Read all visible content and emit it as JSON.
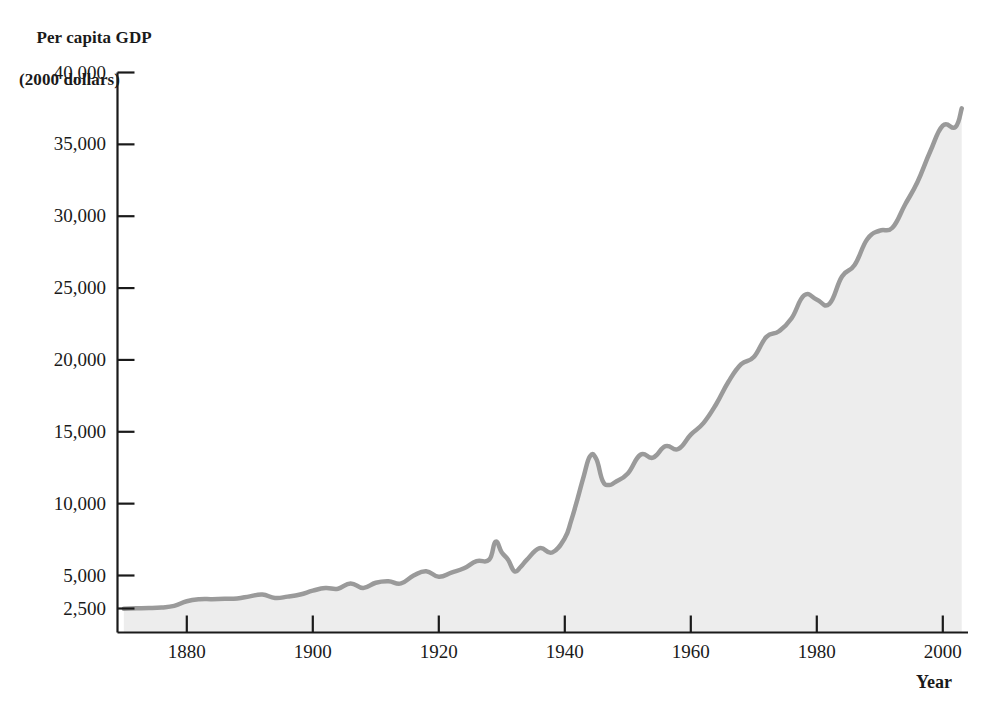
{
  "figure": {
    "y_axis_title_line1": "Per capita GDP",
    "y_axis_title_line2": "(2000 dollars)",
    "x_axis_title": "Year"
  },
  "colors": {
    "line": "#9a9a9a",
    "fill": "#ededed",
    "axis": "#1a1a1a",
    "text": "#1a1a1a",
    "background": "#ffffff"
  },
  "chart_data": {
    "type": "area",
    "title": "Per capita GDP (2000 dollars)",
    "xlabel": "Year",
    "ylabel": "Per capita GDP (2000 dollars)",
    "grid": false,
    "legend": "none",
    "xlim": [
      1869,
      2004
    ],
    "ylim": [
      2100,
      40000
    ],
    "ytick_values": [
      40000,
      35000,
      30000,
      25000,
      20000,
      15000,
      10000,
      5000,
      2500
    ],
    "ytick_labels": [
      "40,000",
      "35,000",
      "30,000",
      "25,000",
      "20,000",
      "15,000",
      "10,000",
      "5,000",
      "2,500"
    ],
    "xtick_values": [
      1880,
      1900,
      1920,
      1940,
      1960,
      1980,
      2000
    ],
    "xtick_labels": [
      "1880",
      "1900",
      "1920",
      "1940",
      "1960",
      "1980",
      "2000"
    ],
    "series": [
      {
        "name": "Per capita GDP",
        "x": [
          1870,
          1872,
          1874,
          1876,
          1878,
          1880,
          1882,
          1884,
          1886,
          1888,
          1890,
          1892,
          1894,
          1896,
          1898,
          1900,
          1902,
          1904,
          1906,
          1908,
          1910,
          1912,
          1914,
          1916,
          1918,
          1920,
          1922,
          1924,
          1926,
          1928,
          1929,
          1930,
          1931,
          1932,
          1933,
          1934,
          1936,
          1938,
          1940,
          1941,
          1942,
          1943,
          1944,
          1945,
          1946,
          1947,
          1948,
          1950,
          1952,
          1954,
          1956,
          1958,
          1960,
          1962,
          1964,
          1966,
          1968,
          1970,
          1972,
          1974,
          1976,
          1978,
          1980,
          1982,
          1984,
          1986,
          1988,
          1990,
          1992,
          1994,
          1996,
          1998,
          2000,
          2002,
          2003
        ],
        "values": [
          2490,
          2510,
          2530,
          2580,
          2700,
          3050,
          3200,
          3210,
          3230,
          3260,
          3420,
          3560,
          3300,
          3400,
          3560,
          3850,
          4050,
          4000,
          4400,
          4050,
          4450,
          4560,
          4400,
          5000,
          5300,
          4900,
          5200,
          5500,
          6000,
          6100,
          7350,
          6600,
          6100,
          5300,
          5600,
          6100,
          6900,
          6600,
          7600,
          8800,
          10300,
          11900,
          13300,
          13100,
          11600,
          11300,
          11500,
          12100,
          13400,
          13200,
          14000,
          13800,
          14800,
          15600,
          16900,
          18500,
          19700,
          20200,
          21600,
          22000,
          22900,
          24500,
          24200,
          23900,
          25800,
          26600,
          28400,
          29000,
          29200,
          30800,
          32400,
          34500,
          36300,
          36200,
          37500
        ]
      }
    ],
    "annotations": [
      {
        "label": "Great Depression trough",
        "x": 1933,
        "y": 5600
      },
      {
        "label": "World War II peak",
        "x": 1944,
        "y": 13300
      },
      {
        "label": "Series end",
        "x": 2003,
        "y": 37500
      }
    ]
  }
}
